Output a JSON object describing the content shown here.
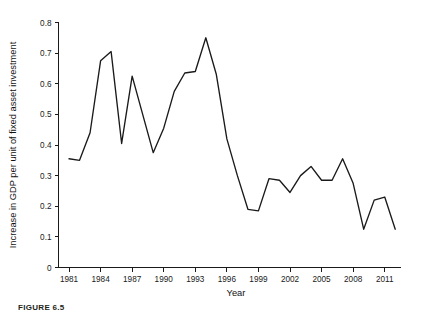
{
  "figure": {
    "caption_label": "FIGURE 6.5"
  },
  "chart_data": {
    "type": "line",
    "title": "",
    "xlabel": "Year",
    "ylabel": "Increase in GDP per unit of fixed asset investment",
    "xlim": [
      1980,
      2012.5
    ],
    "ylim": [
      0,
      0.8
    ],
    "grid": false,
    "legend": null,
    "x_ticks": [
      1981,
      1984,
      1987,
      1990,
      1993,
      1996,
      1999,
      2002,
      2005,
      2008,
      2011
    ],
    "x_tick_labels": [
      "1981",
      "1984",
      "1987",
      "1990",
      "1993",
      "1996",
      "1999",
      "2002",
      "2005",
      "2008",
      "2011"
    ],
    "y_ticks": [
      0,
      0.1,
      0.2,
      0.3,
      0.4,
      0.5,
      0.6,
      0.7,
      0.8
    ],
    "y_tick_labels": [
      "0",
      "0.1",
      "0.2",
      "0.3",
      "0.4",
      "0.5",
      "0.6",
      "0.7",
      "0.8"
    ],
    "line_color": "#1a1a1a",
    "x": [
      1981,
      1982,
      1983,
      1984,
      1985,
      1986,
      1987,
      1988,
      1989,
      1990,
      1991,
      1992,
      1993,
      1994,
      1995,
      1996,
      1997,
      1998,
      1999,
      2000,
      2001,
      2002,
      2003,
      2004,
      2005,
      2006,
      2007,
      2008,
      2009,
      2010,
      2011,
      2012
    ],
    "values": [
      0.355,
      0.35,
      0.44,
      0.675,
      0.705,
      0.405,
      0.625,
      0.5,
      0.375,
      0.455,
      0.575,
      0.635,
      0.64,
      0.75,
      0.63,
      0.42,
      0.3,
      0.19,
      0.185,
      0.29,
      0.285,
      0.245,
      0.3,
      0.33,
      0.285,
      0.285,
      0.355,
      0.275,
      0.125,
      0.22,
      0.23,
      0.125
    ]
  }
}
